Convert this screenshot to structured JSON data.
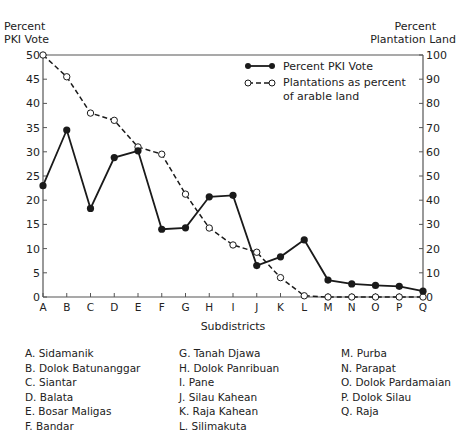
{
  "chart_data": {
    "type": "line",
    "title": "",
    "xlabel": "Subdistricts",
    "ylabel_left": "Percent PKI Vote",
    "ylabel_right": "Percent Plantation Land",
    "ylim_left": [
      0,
      50
    ],
    "ylim_right": [
      0,
      100
    ],
    "left_ticks": [
      0,
      5,
      10,
      15,
      20,
      25,
      30,
      35,
      40,
      45,
      50
    ],
    "right_ticks": [
      0,
      10,
      20,
      30,
      40,
      50,
      60,
      70,
      80,
      90,
      100
    ],
    "grid": false,
    "legend_position": "upper right",
    "categories": [
      "A",
      "B",
      "C",
      "D",
      "E",
      "F",
      "G",
      "H",
      "I",
      "J",
      "K",
      "L",
      "M",
      "N",
      "O",
      "P",
      "Q"
    ],
    "series": [
      {
        "name": "Percent PKI Vote",
        "axis": "left",
        "style": "solid line, filled circle markers",
        "values": [
          23.0,
          34.5,
          18.3,
          28.8,
          30.2,
          14.0,
          14.3,
          20.7,
          21.0,
          6.5,
          8.3,
          11.8,
          3.5,
          2.7,
          2.4,
          2.2,
          1.2
        ]
      },
      {
        "name": "Plantations as percent of arable land",
        "axis": "right",
        "style": "dashed line, open circle markers",
        "values": [
          100,
          91,
          76,
          73,
          62,
          59,
          42.5,
          28.5,
          21.5,
          18.5,
          8,
          0.5,
          0,
          0,
          0,
          0,
          0
        ]
      }
    ],
    "subdistrict_key": [
      {
        "code": "A",
        "name": "Sidamanik"
      },
      {
        "code": "B",
        "name": "Dolok Batunanggar"
      },
      {
        "code": "C",
        "name": "Siantar"
      },
      {
        "code": "D",
        "name": "Balata"
      },
      {
        "code": "E",
        "name": "Bosar Maligas"
      },
      {
        "code": "F",
        "name": "Bandar"
      },
      {
        "code": "G",
        "name": "Tanah Djawa"
      },
      {
        "code": "H",
        "name": "Dolok Panribuan"
      },
      {
        "code": "I",
        "name": "Pane"
      },
      {
        "code": "J",
        "name": "Silau Kahean"
      },
      {
        "code": "K",
        "name": "Raja Kahean"
      },
      {
        "code": "L",
        "name": "Silimakuta"
      },
      {
        "code": "M",
        "name": "Purba"
      },
      {
        "code": "N",
        "name": "Parapat"
      },
      {
        "code": "O",
        "name": "Dolok Pardamaian"
      },
      {
        "code": "P",
        "name": "Dolok Silau"
      },
      {
        "code": "Q",
        "name": "Raja"
      }
    ]
  },
  "labels": {
    "left_axis_line1": "Percent",
    "left_axis_line2": "PKI Vote",
    "right_axis_line1": "Percent",
    "right_axis_line2": "Plantation Land",
    "x_axis": "Subdistricts",
    "legend_pki": "Percent PKI Vote",
    "legend_plant_line1": "Plantations as percent",
    "legend_plant_line2": "of arable land"
  },
  "key_columns": [
    [
      "A. Sidamanik",
      "B. Dolok Batunanggar",
      "C. Siantar",
      "D. Balata",
      "E. Bosar Maligas",
      "F. Bandar"
    ],
    [
      "G. Tanah Djawa",
      "H. Dolok Panribuan",
      "I. Pane",
      "J. Silau Kahean",
      "K. Raja Kahean",
      "L. Silimakuta"
    ],
    [
      "M. Purba",
      "N. Parapat",
      "O. Dolok Pardamaian",
      "P. Dolok Silau",
      "Q. Raja"
    ]
  ],
  "colors": {
    "line": "#1a1a1a",
    "axis": "#555555",
    "background": "#ffffff"
  }
}
